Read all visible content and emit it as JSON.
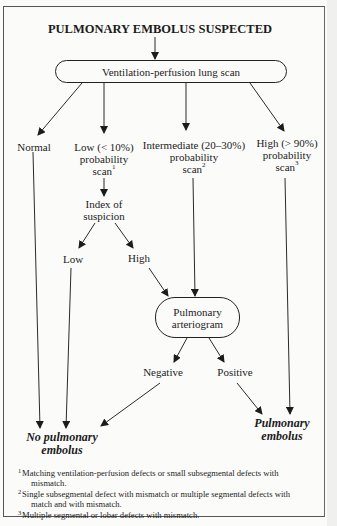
{
  "title": "PULMONARY EMBOLUS SUSPECTED",
  "nodes": {
    "vq_scan": "Ventilation-perfusion lung scan",
    "normal": "Normal",
    "low": {
      "line1": "Low (< 10%)",
      "line2": "probability",
      "line3": "scan",
      "note": "1"
    },
    "intermediate": {
      "line1": "Intermediate (20–30%)",
      "line2": "probability",
      "line3": "scan",
      "note": "2"
    },
    "high": {
      "line1": "High (> 90%)",
      "line2": "probability",
      "line3": "scan",
      "note": "3"
    },
    "index": {
      "line1": "Index of",
      "line2": "suspicion"
    },
    "index_low": "Low",
    "index_high": "High",
    "arteriogram": {
      "line1": "Pulmonary",
      "line2": "arteriogram"
    },
    "negative": "Negative",
    "positive": "Positive",
    "no_pe": {
      "line1": "No pulmonary",
      "line2": "embolus"
    },
    "pe": {
      "line1": "Pulmonary",
      "line2": "embolus"
    }
  },
  "footnotes": [
    {
      "num": "1",
      "line1": "Matching ventilation-perfusion defects or small subsegmental defects with",
      "line2": "mismatch."
    },
    {
      "num": "2",
      "line1": "Single subsegmental defect with mismatch or multiple segmental defects with",
      "line2": "match and with mismatch."
    },
    {
      "num": "3",
      "line1": "Multiple segmental or lobar defects with mismatch.",
      "line2": ""
    }
  ]
}
